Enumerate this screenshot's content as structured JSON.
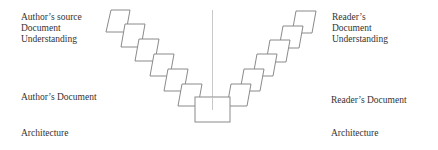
{
  "diagram": {
    "left": {
      "source_label": [
        "Author’s source",
        "Document",
        "Understanding"
      ],
      "document_label": "Author’s Document",
      "architecture_label": "Architecture"
    },
    "right": {
      "source_label": [
        "Reader’s",
        "Document",
        "Understanding"
      ],
      "document_label": "Reader’s Document",
      "architecture_label": "Architecture"
    },
    "stroke_color": "#8a8a8a",
    "divider_color": "#c8c8c8"
  }
}
